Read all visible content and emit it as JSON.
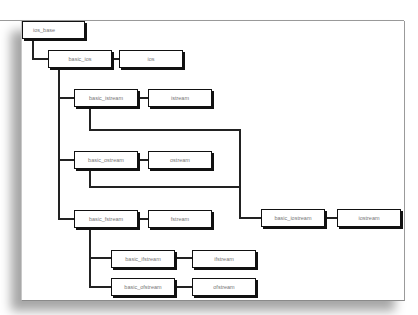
{
  "diagram": {
    "type": "class-hierarchy",
    "nodes": {
      "ios_base": "ios_base",
      "basic_ios": "basic_ios",
      "ios": "ios",
      "basic_istream": "basic_istream",
      "istream": "istream",
      "basic_ostream": "basic_ostream",
      "ostream": "ostream",
      "basic_fstream": "basic_fstream",
      "fstream": "fstream",
      "basic_ifstream": "basic_ifstream",
      "ifstream": "ifstream",
      "basic_ofstream": "basic_ofstream",
      "ofstream": "ofstream",
      "basic_iostream": "basic_iostream",
      "iostream": "iostream"
    },
    "edges": [
      [
        "ios_base",
        "basic_ios"
      ],
      [
        "basic_ios",
        "ios"
      ],
      [
        "basic_ios",
        "basic_istream"
      ],
      [
        "basic_istream",
        "istream"
      ],
      [
        "basic_ios",
        "basic_ostream"
      ],
      [
        "basic_ostream",
        "ostream"
      ],
      [
        "basic_ios",
        "basic_fstream"
      ],
      [
        "basic_fstream",
        "fstream"
      ],
      [
        "basic_fstream",
        "basic_ifstream"
      ],
      [
        "basic_ifstream",
        "ifstream"
      ],
      [
        "basic_fstream",
        "basic_ofstream"
      ],
      [
        "basic_ofstream",
        "ofstream"
      ],
      [
        "basic_istream",
        "basic_iostream"
      ],
      [
        "basic_ostream",
        "basic_iostream"
      ],
      [
        "basic_iostream",
        "iostream"
      ]
    ]
  }
}
